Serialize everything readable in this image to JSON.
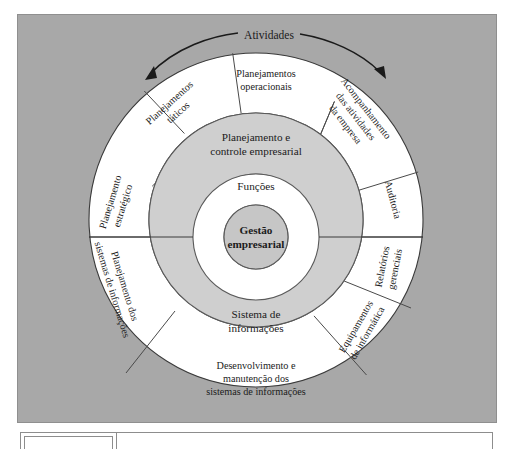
{
  "figure": {
    "title_label": "Atividades",
    "background_color": "#a8a8a8",
    "ring_gray_color": "#cfcfcf",
    "core_gray_color": "#c6c6c6",
    "ring_white_color": "#ffffff"
  },
  "center": {
    "core_line1": "Gestão",
    "core_line2": "empresarial",
    "inner_ring_label": "Funções"
  },
  "middle_ring": {
    "top_line1": "Planejamento e",
    "top_line2": "controle empresarial",
    "bottom_line1": "Sistema de",
    "bottom_line2": "informações"
  },
  "outer_ring": {
    "segments": [
      {
        "id": "planejamentos-operacionais",
        "line1": "Planejamentos",
        "line2": "operacionais",
        "line3": ""
      },
      {
        "id": "planejamentos-taticos",
        "line1": "Planejamentos",
        "line2": "táticos",
        "line3": ""
      },
      {
        "id": "planejamento-estrategico",
        "line1": "Planejamento",
        "line2": "estratégico",
        "line3": ""
      },
      {
        "id": "planejamento-dos-sistemas-de-informacoes",
        "line1": "Planejamento dos",
        "line2": "sistemas de informações",
        "line3": ""
      },
      {
        "id": "desenvolvimento-e-manutencao",
        "line1": "Desenvolvimento e",
        "line2": "manutenção dos",
        "line3": "sistemas de informações"
      },
      {
        "id": "equipamentos-de-informatica",
        "line1": "Equipamentos",
        "line2": "de informática",
        "line3": ""
      },
      {
        "id": "relatorios-gerenciais",
        "line1": "Relatórios",
        "line2": "gerenciais",
        "line3": ""
      },
      {
        "id": "auditoria",
        "line1": "Auditoria",
        "line2": "",
        "line3": ""
      },
      {
        "id": "acompanhamento-das-atividades",
        "line1": "Acompanhamento",
        "line2": "das atividades",
        "line3": "da empresa"
      }
    ]
  },
  "caption_table": {
    "cells": [
      "",
      ""
    ]
  }
}
